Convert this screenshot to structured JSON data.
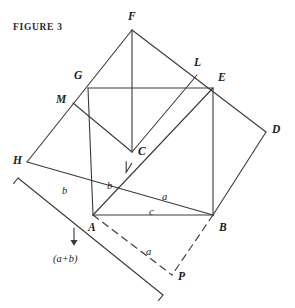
{
  "figure": {
    "caption": "FIGURE 3",
    "stroke_color": "#3a3a3a",
    "background": "#ffffff"
  },
  "vertices": [
    {
      "id": "F",
      "label": "F",
      "x": 132,
      "y": 30,
      "lx": 128,
      "ly": 11
    },
    {
      "id": "L",
      "label": "L",
      "x": 197,
      "y": 75,
      "lx": 194,
      "ly": 57
    },
    {
      "id": "E",
      "label": "E",
      "x": 213,
      "y": 88,
      "lx": 218,
      "ly": 72
    },
    {
      "id": "G",
      "label": "G",
      "x": 88,
      "y": 88,
      "lx": 74,
      "ly": 70
    },
    {
      "id": "M",
      "label": "M",
      "x": 73,
      "y": 103,
      "lx": 56,
      "ly": 94
    },
    {
      "id": "D",
      "label": "D",
      "x": 266,
      "y": 132,
      "lx": 272,
      "ly": 124
    },
    {
      "id": "C",
      "label": "C",
      "x": 132,
      "y": 152,
      "lx": 138,
      "ly": 146
    },
    {
      "id": "H",
      "label": "H",
      "x": 27,
      "y": 162,
      "lx": 13,
      "ly": 155
    },
    {
      "id": "A",
      "label": "A",
      "x": 93,
      "y": 215,
      "lx": 88,
      "ly": 222
    },
    {
      "id": "B",
      "label": "B",
      "x": 213,
      "y": 215,
      "lx": 219,
      "ly": 222
    },
    {
      "id": "P",
      "label": "P",
      "x": 172,
      "y": 275,
      "lx": 178,
      "ly": 271
    }
  ],
  "side_labels": [
    {
      "id": "b-left",
      "label": "b",
      "x": 62,
      "y": 186
    },
    {
      "id": "b-inner",
      "label": "b",
      "x": 107,
      "y": 181
    },
    {
      "id": "a-inner",
      "label": "a",
      "x": 162,
      "y": 192
    },
    {
      "id": "c-base",
      "label": "c",
      "x": 149,
      "y": 207
    },
    {
      "id": "a-dashed",
      "label": "a",
      "x": 146,
      "y": 247
    }
  ],
  "sum_label": {
    "text": "(a+b)",
    "x": 53,
    "y": 254
  },
  "arrow": {
    "x": 74,
    "y_top": 228,
    "y_bottom": 246
  },
  "solid_edges": [
    {
      "name": "H-F",
      "from": "H",
      "to": "F"
    },
    {
      "name": "F-D",
      "from": "F",
      "to": "D"
    },
    {
      "name": "D-B",
      "from": "D",
      "to": "B"
    },
    {
      "name": "B-H",
      "from": "B",
      "to": "H"
    },
    {
      "name": "A-G",
      "from": "A",
      "to": "G"
    },
    {
      "name": "G-E",
      "from": "G",
      "to": "E"
    },
    {
      "name": "E-B",
      "from": "E",
      "to": "B"
    },
    {
      "name": "B-A",
      "from": "B",
      "to": "A"
    },
    {
      "name": "F-C",
      "from": "F",
      "to": "C"
    },
    {
      "name": "A-E",
      "from": "A",
      "to": "E"
    },
    {
      "name": "M-C",
      "from": "M",
      "to": "C"
    },
    {
      "name": "C-L",
      "from": "C",
      "to": "L"
    }
  ],
  "dashed_edges": [
    {
      "name": "A-P",
      "from": "A",
      "to": "P"
    },
    {
      "name": "B-P",
      "from": "B",
      "to": "P"
    }
  ],
  "right_angle": {
    "at": "C",
    "size": 11
  },
  "measure_bracket": {
    "from_x": 18,
    "from_y": 178,
    "to_x": 163,
    "to_y": 295,
    "tick": 7
  }
}
